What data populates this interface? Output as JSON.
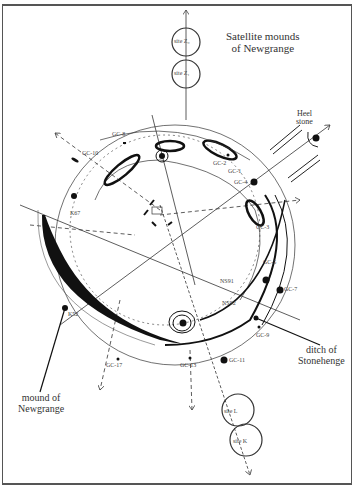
{
  "diagram": {
    "title_annotations": {
      "satellite": "Satellite mounds\nof Newgrange",
      "heel_stone": "Heel\nstone",
      "ditch": "ditch of\nStonehenge",
      "mound": "mound of\nNewgrange"
    },
    "sites": {
      "z0": {
        "prefix": "site",
        "id": "Z₀"
      },
      "z1": {
        "prefix": "site",
        "id": "Z₁"
      },
      "l": {
        "prefix": "site",
        "id": "L"
      },
      "k": {
        "prefix": "site",
        "id": "K"
      }
    },
    "markers": [
      "GC-8",
      "GC-10",
      "GC-2",
      "GC-1",
      "GC-4",
      "GC-3",
      "GC-5",
      "GC-7",
      "GC-9",
      "GC-11",
      "GC-13",
      "GC-17",
      "K67",
      "K52",
      "NS91",
      "NS92"
    ],
    "colors": {
      "ink": "#222222",
      "frame": "#555555",
      "background": "#ffffff"
    }
  }
}
